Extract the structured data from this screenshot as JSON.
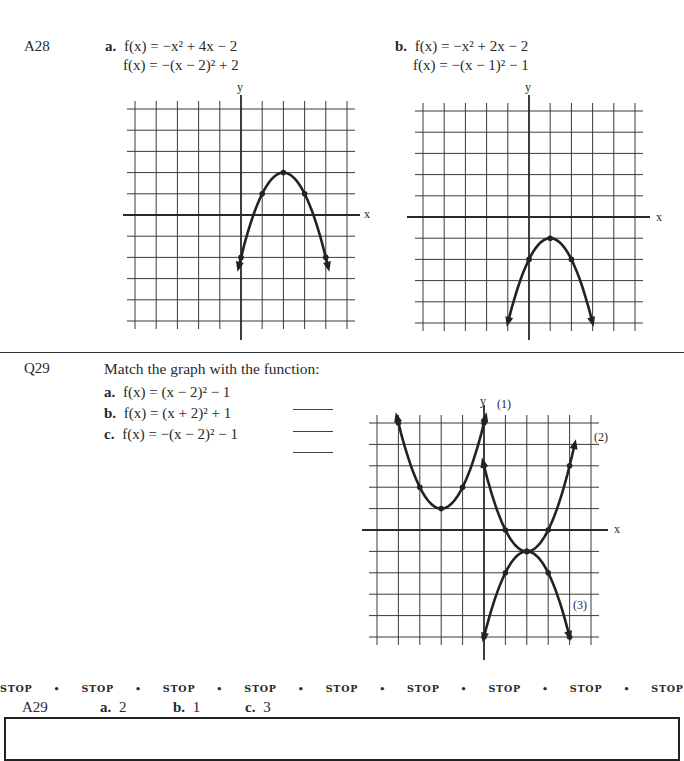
{
  "a28": {
    "label": "A28",
    "a": {
      "letter": "a.",
      "line1": "f(x) = −x² + 4x − 2",
      "line2": "f(x) = −(x − 2)² + 2"
    },
    "b": {
      "letter": "b.",
      "line1": "f(x) = −x² + 2x − 2",
      "line2": "f(x) = −(x − 1)² − 1"
    }
  },
  "q29": {
    "label": "Q29",
    "prompt": "Match the graph with the function:",
    "items": [
      {
        "letter": "a.",
        "expr": "f(x) = (x − 2)² − 1"
      },
      {
        "letter": "b.",
        "expr": "f(x) = (x + 2)² + 1"
      },
      {
        "letter": "c.",
        "expr": "f(x) = −(x − 2)² − 1"
      }
    ],
    "curve_labels": [
      "(1)",
      "(2)",
      "(3)"
    ]
  },
  "axes": {
    "x": "x",
    "y": "y"
  },
  "stop_row": [
    "STOP",
    "•",
    "STOP",
    "•",
    "STOP",
    "•",
    "STOP",
    "•",
    "STOP",
    "•",
    "STOP",
    "•",
    "STOP",
    "•",
    "STOP",
    "•",
    "STOP"
  ],
  "a29": {
    "label": "A29",
    "answers": [
      {
        "letter": "a.",
        "value": "2"
      },
      {
        "letter": "b.",
        "value": "1"
      },
      {
        "letter": "c.",
        "value": "3"
      }
    ]
  },
  "chart_data": [
    {
      "type": "line",
      "title": "A28 a. f(x) = −(x − 2)² + 2",
      "xlabel": "x",
      "ylabel": "y",
      "xlim": [
        -5,
        5
      ],
      "ylim": [
        -5,
        5
      ],
      "grid": true,
      "series": [
        {
          "name": "f(x) = −(x − 2)² + 2",
          "points": [
            [
              0,
              -2
            ],
            [
              1,
              1
            ],
            [
              2,
              2
            ],
            [
              3,
              1
            ],
            [
              4,
              -2
            ]
          ]
        }
      ]
    },
    {
      "type": "line",
      "title": "A28 b. f(x) = −(x − 1)² − 1",
      "xlabel": "x",
      "ylabel": "y",
      "xlim": [
        -5,
        5
      ],
      "ylim": [
        -5,
        5
      ],
      "grid": true,
      "series": [
        {
          "name": "f(x) = −(x − 1)² − 1",
          "points": [
            [
              -1,
              -5
            ],
            [
              0,
              -2
            ],
            [
              1,
              -1
            ],
            [
              2,
              -2
            ],
            [
              3,
              -5
            ]
          ]
        }
      ]
    },
    {
      "type": "line",
      "title": "Q29 Match the graph with the function",
      "xlabel": "x",
      "ylabel": "y",
      "xlim": [
        -5,
        5
      ],
      "ylim": [
        -5,
        5
      ],
      "grid": true,
      "series": [
        {
          "name": "(1)",
          "points": [
            [
              -4,
              5
            ],
            [
              -3,
              2
            ],
            [
              -2,
              1
            ],
            [
              -1,
              2
            ],
            [
              0,
              5
            ]
          ]
        },
        {
          "name": "(2)",
          "points": [
            [
              0,
              3
            ],
            [
              1,
              0
            ],
            [
              2,
              -1
            ],
            [
              3,
              0
            ],
            [
              4,
              3
            ]
          ]
        },
        {
          "name": "(3)",
          "points": [
            [
              0,
              -5
            ],
            [
              1,
              -2
            ],
            [
              2,
              -1
            ],
            [
              3,
              -2
            ],
            [
              4,
              -5
            ]
          ]
        }
      ]
    }
  ]
}
